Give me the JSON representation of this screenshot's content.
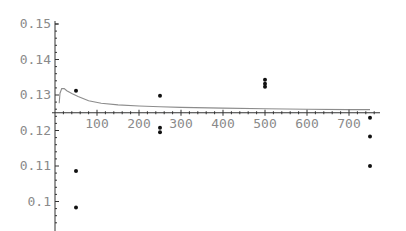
{
  "chart_data": {
    "type": "scatter",
    "title": "",
    "xlabel": "",
    "ylabel": "",
    "xlim": [
      0,
      770
    ],
    "ylim": [
      0.093,
      0.15
    ],
    "axes_origin": {
      "x": 0,
      "y": 0.125
    },
    "grid": false,
    "legend": null,
    "x_ticks": [
      100,
      200,
      300,
      400,
      500,
      600,
      700
    ],
    "x_tick_labels": [
      "100",
      "200",
      "300",
      "400",
      "500",
      "600",
      "700"
    ],
    "y_ticks": [
      0.1,
      0.11,
      0.12,
      0.13,
      0.14,
      0.15
    ],
    "y_tick_labels": [
      "0.1",
      "0.11",
      "0.12",
      "0.13",
      "0.14",
      "0.15"
    ],
    "series": [
      {
        "name": "points",
        "type": "scatter",
        "color": "#111111",
        "x": [
          50,
          50,
          50,
          250,
          250,
          250,
          500,
          500,
          500,
          750,
          750,
          750
        ],
        "y": [
          0.1312,
          0.1086,
          0.0983,
          0.1298,
          0.1208,
          0.1195,
          0.1343,
          0.1332,
          0.1323,
          0.1236,
          0.1183,
          0.11
        ]
      },
      {
        "name": "curve",
        "type": "line",
        "color": "#8c8c8c",
        "x": [
          10,
          12,
          16,
          22,
          28,
          40,
          55,
          80,
          110,
          150,
          200,
          250,
          300,
          400,
          500,
          600,
          700,
          750
        ],
        "y": [
          0.1277,
          0.1305,
          0.1318,
          0.1318,
          0.1312,
          0.1304,
          0.1296,
          0.1284,
          0.1277,
          0.1272,
          0.1269,
          0.1267,
          0.1265,
          0.1263,
          0.1261,
          0.126,
          0.1259,
          0.1259
        ]
      }
    ]
  }
}
